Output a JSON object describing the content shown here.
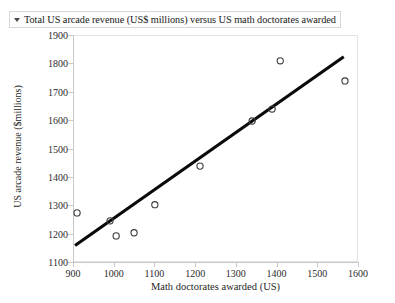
{
  "titlebar": {
    "caret_icon": "disclosure-triangle-icon",
    "title": "Total US arcade revenue (US$ millions) versus US math doctorates awarded"
  },
  "chart_data": {
    "type": "scatter",
    "title": "Total US arcade revenue (US$ millions) versus US math doctorates awarded",
    "xlabel": "Math doctorates awarded (US)",
    "ylabel": "US arcade revenue ($millions)",
    "xlim": [
      900,
      1600
    ],
    "ylim": [
      1100,
      1900
    ],
    "xticks": [
      900,
      1000,
      1100,
      1200,
      1300,
      1400,
      1500,
      1600
    ],
    "yticks": [
      1100,
      1200,
      1300,
      1400,
      1500,
      1600,
      1700,
      1800,
      1900
    ],
    "grid": false,
    "legend": "none",
    "marker": "open-circle",
    "marker_color": "#3a3a3a",
    "points": [
      {
        "x": 910,
        "y": 1273
      },
      {
        "x": 991,
        "y": 1245
      },
      {
        "x": 1006,
        "y": 1192
      },
      {
        "x": 1050,
        "y": 1203
      },
      {
        "x": 1101,
        "y": 1302
      },
      {
        "x": 1212,
        "y": 1438
      },
      {
        "x": 1340,
        "y": 1597
      },
      {
        "x": 1389,
        "y": 1639
      },
      {
        "x": 1409,
        "y": 1809
      },
      {
        "x": 1568,
        "y": 1738
      }
    ],
    "trendline": {
      "label": "linear fit",
      "color": "#0a0a0a",
      "x_start": 905,
      "y_start": 1158,
      "x_end": 1565,
      "y_end": 1823
    }
  }
}
